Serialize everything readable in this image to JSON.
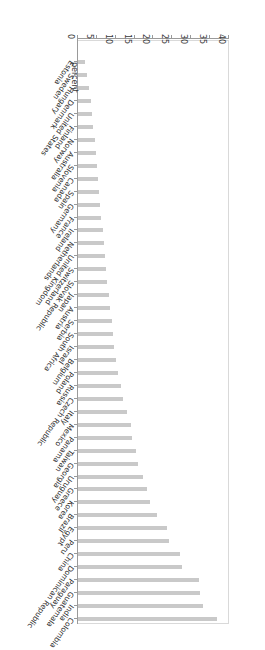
{
  "figure": {
    "rotation_degrees": 180,
    "bar_color": "#c9c9c9",
    "axis_color": "#9a9a9a",
    "text_color": "#2b2b2b"
  },
  "chart_data": {
    "type": "bar",
    "orientation": "horizontal",
    "title": "",
    "xlabel": "",
    "ylabel": "percent",
    "ylim": [
      0,
      40
    ],
    "grid": false,
    "legend": "none",
    "tick_labels": [
      "0",
      "5",
      "10",
      "15",
      "20",
      "25",
      "30",
      "35",
      "40"
    ],
    "ticks": [
      0,
      5,
      10,
      15,
      20,
      25,
      30,
      35,
      40
    ],
    "categories": [
      "Colombia",
      "India",
      "Guatemala",
      "Paraguay",
      "Dominican Republic",
      "China",
      "Peru",
      "Egypt",
      "Brazil",
      "Korea",
      "Greece",
      "Uruguay",
      "Georgia",
      "Taiwan",
      "Panama",
      "Mexico",
      "Italy",
      "Czech Republic",
      "Russia",
      "Poland",
      "Belgium",
      "Israel",
      "South Africa",
      "Serbia",
      "Austria",
      "Japan",
      "Slovak Republic",
      "Switzerland",
      "United Kingdom",
      "Netherlands",
      "Ireland",
      "France",
      "Germany",
      "Spain",
      "Canada",
      "Slovenia",
      "Australia",
      "Norway",
      "Finland",
      "United States",
      "Denmark",
      "Hungary",
      "Sweden",
      "Estonia"
    ],
    "values": [
      36.8,
      33.1,
      32.4,
      32.0,
      27.6,
      26.9,
      24.0,
      23.7,
      21.0,
      19.1,
      18.4,
      17.3,
      16.0,
      15.3,
      14.4,
      14.0,
      13.1,
      12.0,
      11.3,
      10.7,
      10.1,
      9.6,
      9.2,
      8.9,
      8.5,
      8.1,
      7.7,
      7.4,
      7.1,
      6.8,
      6.5,
      6.2,
      5.9,
      5.6,
      5.3,
      5.0,
      4.7,
      4.4,
      4.1,
      3.8,
      3.4,
      3.0,
      2.4,
      1.8
    ]
  }
}
